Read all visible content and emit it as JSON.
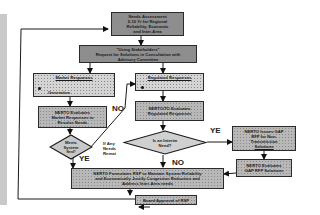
{
  "diagram": {
    "type": "flowchart",
    "nodes": {
      "needs_assessment": {
        "lines": [
          "Needs Assessment",
          "5-10 Yr for Regional",
          "Reliability, Economic",
          "and Inter-Area"
        ]
      },
      "request_solutions": {
        "lines": [
          "\"Using Stakeholders\"",
          "Request for Solutions in Consultation with",
          "Advisory Committee"
        ]
      },
      "market_responses": {
        "title": "Market Responses",
        "sub": "Generation"
      },
      "regulated_responses": {
        "title": "Regulated Responses"
      },
      "nerto_eval_market": {
        "lines": [
          "NERTO Evaluates",
          "Market Responses to",
          "Resolve Needs"
        ]
      },
      "nerto_eval_regulated": {
        "lines": [
          "NERTO/TO Evaluates",
          "Regulated Responses"
        ]
      },
      "meets_system": {
        "lines": [
          "Meets",
          "System",
          "Need?"
        ]
      },
      "interim_need": {
        "lines": [
          "Is an Interim",
          "Need?"
        ]
      },
      "nerto_issues_gap": {
        "lines": [
          "NERTO Issues GAP",
          "RFP for Non-",
          "Transmission",
          "Solutions"
        ]
      },
      "nerto_eval_gap": {
        "lines": [
          "NERTO Evaluates",
          "GAP RFP Solutions"
        ]
      },
      "formulates_rsp": {
        "lines": [
          "NERTO Formulates RSP to Maintain System Reliability",
          "and Economically Justify Congestion Reduction and",
          "Address Inter-Area needs"
        ]
      },
      "board_approval": {
        "lines": [
          "Board Approval of RSP"
        ]
      }
    },
    "edge_labels": {
      "no_left": "NO",
      "yes_left": "YE",
      "if_any_needs": [
        "If Any",
        "Needs",
        "Remai"
      ],
      "yes_right": "YE",
      "no_bottom": "NO"
    },
    "colors": {
      "box_fill": "#b8b8b8",
      "box_dark": "#8e8e8e",
      "stroke": "#1a1a1a",
      "side_strip": "#c9c9c9"
    }
  }
}
